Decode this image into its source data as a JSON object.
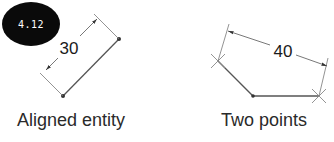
{
  "badge": {
    "label": "4.12"
  },
  "figures": [
    {
      "id": "aligned-entity",
      "caption": "Aligned entity",
      "dimension_value": "30"
    },
    {
      "id": "two-points",
      "caption": "Two points",
      "dimension_value": "40"
    }
  ],
  "colors": {
    "badge_bg": "#0a0a0a",
    "badge_text": "#ffffff",
    "line": "#555555",
    "text": "#2a2a2a"
  }
}
